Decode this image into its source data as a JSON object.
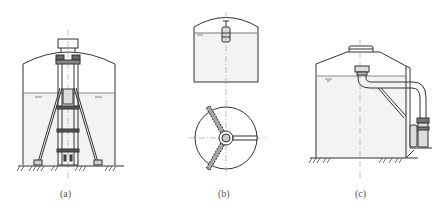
{
  "figure": {
    "panels": [
      {
        "id": "a",
        "label": "(a)",
        "description": "Vertical tank with submerged support frame/column structure on tripod legs"
      },
      {
        "id": "b",
        "label": "(b)",
        "description": "Tank elevation with top-mounted fixture and plan view with three radial arms"
      },
      {
        "id": "c",
        "label": "(c)",
        "description": "Tank with internal inlet and external elbow pipe leading to side-mounted unit"
      }
    ],
    "colors": {
      "line": "#333333",
      "liquid": "#f2f2f2",
      "background": "#ffffff"
    }
  }
}
